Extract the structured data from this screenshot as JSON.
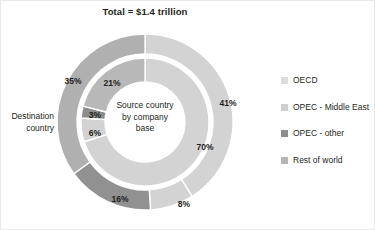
{
  "chart_data": {
    "type": "pie",
    "title": "Total = $1.4 trillion",
    "center_label": "Source country\nby company\nbase",
    "outer_ring_label": "Destination\ncountry",
    "legend_position": "right",
    "rings": [
      {
        "name": "Destination country",
        "ring": "outer",
        "categories": [
          "OECD",
          "OPEC - Middle East",
          "OPEC - other",
          "Rest of world"
        ],
        "values": [
          41,
          8,
          16,
          35
        ],
        "labels": [
          "41%",
          "8%",
          "16%",
          "35%"
        ],
        "colors": [
          "#d3d3d3",
          "#d3d3d3",
          "#919191",
          "#b0b0b0"
        ]
      },
      {
        "name": "Source country by company base",
        "ring": "inner",
        "categories": [
          "OECD",
          "OPEC - Middle East",
          "OPEC - other",
          "Rest of world"
        ],
        "values": [
          70,
          6,
          3,
          21
        ],
        "labels": [
          "70%",
          "6%",
          "3%",
          "21%"
        ],
        "colors": [
          "#d3d3d3",
          "#d3d3d3",
          "#8d8d8d",
          "#b8b8b8"
        ]
      }
    ],
    "legend": [
      {
        "label": "OECD",
        "color": "#dcdcdc"
      },
      {
        "label": "OPEC - Middle East",
        "color": "#cfcfcf"
      },
      {
        "label": "OPEC - other",
        "color": "#8d8d8d"
      },
      {
        "label": "Rest of world",
        "color": "#b5b5b5"
      }
    ],
    "slice_labels_outer": [
      {
        "text": "41%",
        "x": 228,
        "y": 103
      },
      {
        "text": "8%",
        "x": 184,
        "y": 204
      },
      {
        "text": "16%",
        "x": 120,
        "y": 199
      },
      {
        "text": "35%",
        "x": 73,
        "y": 81
      }
    ],
    "slice_labels_inner": [
      {
        "text": "70%",
        "x": 205,
        "y": 147
      },
      {
        "text": "6%",
        "x": 95,
        "y": 133
      },
      {
        "text": "3%",
        "x": 95,
        "y": 115
      },
      {
        "text": "21%",
        "x": 112,
        "y": 83
      }
    ]
  },
  "title": {
    "text": "Total = $1.4 trillion"
  },
  "center": {
    "line1": "Source country",
    "line2": "by company",
    "line3": "base"
  },
  "destination": {
    "line1": "Destination",
    "line2": "country"
  },
  "legend": {
    "items": [
      {
        "label": "OECD"
      },
      {
        "label": "OPEC - Middle East"
      },
      {
        "label": "OPEC - other"
      },
      {
        "label": "Rest of world"
      }
    ]
  }
}
